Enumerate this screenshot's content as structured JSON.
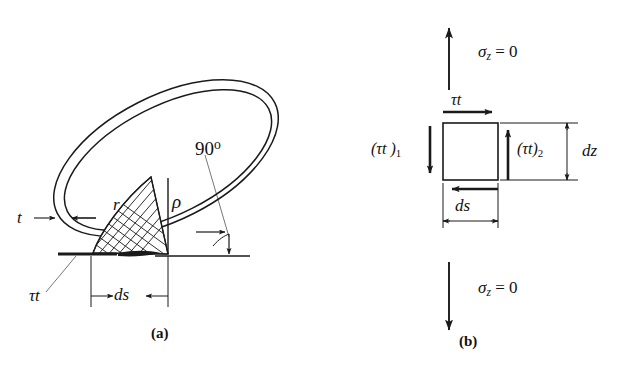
{
  "figure": {
    "background_color": "#ffffff",
    "line_color": "#1a1a1a",
    "width": 630,
    "height": 371
  },
  "panel_a": {
    "caption": "(a)",
    "labels": {
      "thickness": "t",
      "radius": "r",
      "rho": "ρ",
      "angle": "90",
      "angle_degree_symbol": "o",
      "shear_flow": "τt",
      "arc_length": "ds"
    },
    "description": "Elliptical thin-walled tube cross-section with cross-hatched triangular area element"
  },
  "panel_b": {
    "caption": "(b)",
    "labels": {
      "sigma_top": "σ",
      "sigma_top_sub": "z",
      "sigma_top_value": "= 0",
      "sigma_bottom": "σ",
      "sigma_bottom_sub": "z",
      "sigma_bottom_value": "= 0",
      "tau_t_top": "τt",
      "tau_t_left": "(τt )",
      "tau_t_left_sub": "1",
      "tau_t_right": "(τt)",
      "tau_t_right_sub": "2",
      "dz": "dz",
      "ds": "ds"
    },
    "description": "Free-body element of tube wall showing shear flows and zero axial stresses"
  }
}
